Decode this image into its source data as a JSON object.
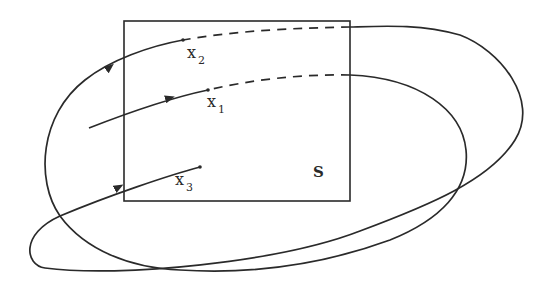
{
  "diagram": {
    "set_label": "S",
    "points": [
      {
        "name": "x",
        "subscript": "2"
      },
      {
        "name": "x",
        "subscript": "1"
      },
      {
        "name": "x",
        "subscript": "3"
      }
    ],
    "colors": {
      "stroke": "#2a2a2a",
      "background": "#ffffff"
    }
  }
}
